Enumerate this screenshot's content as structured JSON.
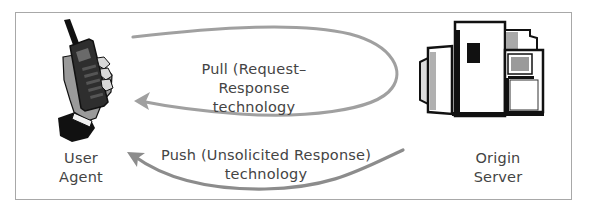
{
  "diagram": {
    "nodes": {
      "user_agent": {
        "line1": "User",
        "line2": "Agent",
        "icon": "mobile-phone-in-hand-icon"
      },
      "origin_server": {
        "line1": "Origin",
        "line2": "Server",
        "icon": "server-mainframe-icon"
      }
    },
    "edges": {
      "pull": {
        "line1": "Pull (Request–Response",
        "line2": "technology",
        "direction": "user_agent -> origin_server -> user_agent"
      },
      "push": {
        "line1": "Push (Unsolicited Response)",
        "line2": "technology",
        "direction": "origin_server -> user_agent"
      }
    },
    "colors": {
      "pull_arrow": "#a0a0a0",
      "push_arrow": "#8c8c8c",
      "frame": "#a8a8a8",
      "text": "#444444"
    }
  }
}
